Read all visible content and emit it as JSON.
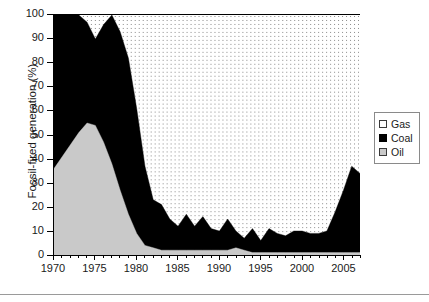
{
  "chart_data": {
    "type": "area",
    "stacked": true,
    "stack_total": 100,
    "title": "",
    "subtitle": "",
    "xlabel": "",
    "ylabel": "Fossil-fired generation (%)",
    "xlim": [
      1970,
      2007
    ],
    "ylim": [
      0,
      100
    ],
    "grid": false,
    "legend_position": "right-outside",
    "y_ticks": [
      0,
      10,
      20,
      30,
      40,
      50,
      60,
      70,
      80,
      90,
      100
    ],
    "x_ticks": [
      1970,
      1975,
      1980,
      1985,
      1990,
      1995,
      2000,
      2005
    ],
    "x_minor_tick_step": 1,
    "x": [
      1970,
      1971,
      1972,
      1973,
      1974,
      1975,
      1976,
      1977,
      1978,
      1979,
      1980,
      1981,
      1982,
      1983,
      1984,
      1985,
      1986,
      1987,
      1988,
      1989,
      1990,
      1991,
      1992,
      1993,
      1994,
      1995,
      1996,
      1997,
      1998,
      1999,
      2000,
      2001,
      2002,
      2003,
      2004,
      2005,
      2006,
      2007
    ],
    "colors": {
      "gas": "#ffffff",
      "coal": "#000000",
      "oil": "#c9c9c9"
    },
    "series": [
      {
        "name": "Oil",
        "key": "oil",
        "color": "#c9c9c9",
        "values": [
          36,
          41,
          46,
          51,
          55,
          54,
          47,
          38,
          27,
          17,
          9,
          4,
          3,
          2,
          2,
          2,
          2,
          2,
          2,
          2,
          2,
          2,
          3,
          2,
          1,
          1,
          1,
          1,
          1,
          1,
          1,
          1,
          1,
          1,
          1,
          1,
          1,
          1
        ]
      },
      {
        "name": "Coal",
        "key": "coal",
        "color": "#000000",
        "values": [
          64,
          59,
          54,
          49,
          42,
          36,
          49,
          62,
          66,
          65,
          52,
          33,
          20,
          19,
          13,
          10,
          15,
          10,
          14,
          9,
          8,
          13,
          7,
          5,
          10,
          5,
          10,
          8,
          7,
          9,
          9,
          8,
          8,
          9,
          17,
          26,
          36,
          33
        ]
      },
      {
        "name": "Gas",
        "key": "gas",
        "color": "#ffffff",
        "values": [
          0,
          0,
          0,
          0,
          3,
          10,
          4,
          0,
          7,
          18,
          39,
          63,
          77,
          79,
          85,
          88,
          83,
          88,
          84,
          89,
          90,
          85,
          90,
          93,
          89,
          94,
          89,
          91,
          92,
          90,
          90,
          91,
          91,
          90,
          82,
          73,
          63,
          66
        ]
      }
    ],
    "legend_entries": [
      {
        "label": "Gas",
        "key": "gas"
      },
      {
        "label": "Coal",
        "key": "coal"
      },
      {
        "label": "Oil",
        "key": "oil"
      }
    ]
  },
  "axes": {
    "y_title": "Fossil-fired generation (%)",
    "y_tick_labels": [
      "0",
      "10",
      "20",
      "30",
      "40",
      "50",
      "60",
      "70",
      "80",
      "90",
      "100"
    ],
    "x_tick_labels": [
      "1970",
      "1975",
      "1980",
      "1985",
      "1990",
      "1995",
      "2000",
      "2005"
    ]
  },
  "legend": {
    "items": [
      {
        "label": "Gas"
      },
      {
        "label": "Coal"
      },
      {
        "label": "Oil"
      }
    ]
  }
}
